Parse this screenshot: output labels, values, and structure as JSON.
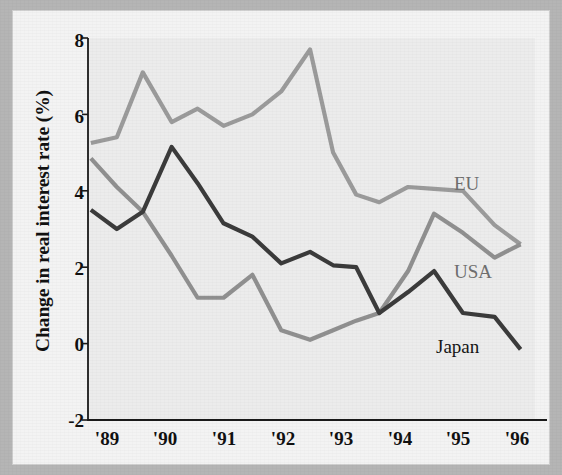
{
  "figure": {
    "ylabel": "Change in real interest rate (%)",
    "y_ticks": [
      "8",
      "6",
      "4",
      "2",
      "0",
      "-2"
    ],
    "x_ticks": [
      "'89",
      "'90",
      "'91",
      "'92",
      "'93",
      "'94",
      "'95",
      "'96"
    ],
    "labels": {
      "eu": "EU",
      "usa": "USA",
      "japan": "Japan"
    },
    "colors": {
      "eu": "#9b9b9b",
      "usa": "#909090",
      "japan": "#3b3b3b",
      "axis": "#1a1a1a",
      "plot_background": "#ececec",
      "paper": "#f3f3f3"
    }
  },
  "chart_data": {
    "type": "line",
    "title": "",
    "subtitle": "",
    "xlabel": "",
    "ylabel": "Change in real interest rate (%)",
    "xlim": [
      1988.75,
      1996.5
    ],
    "ylim": [
      -2,
      8
    ],
    "y_ticks": [
      8,
      6,
      4,
      2,
      0,
      -2
    ],
    "x_tick_values": [
      1989,
      1990,
      1991,
      1992,
      1993,
      1994,
      1995,
      1996
    ],
    "x_tick_labels": [
      "'89",
      "'90",
      "'91",
      "'92",
      "'93",
      "'94",
      "'95",
      "'96"
    ],
    "grid": false,
    "legend": "inline-labels-right",
    "annotations": [
      {
        "text": "EU",
        "x": 1995.1,
        "y": 4.6
      },
      {
        "text": "USA",
        "x": 1995.1,
        "y": 2.3
      },
      {
        "text": "Japan",
        "x": 1994.8,
        "y": 0.35
      }
    ],
    "x": [
      1988.8,
      1989.25,
      1989.7,
      1990.2,
      1990.65,
      1991.1,
      1991.6,
      1992.1,
      1992.6,
      1993.0,
      1993.4,
      1993.8,
      1994.3,
      1994.75,
      1995.25,
      1995.8,
      1996.25
    ],
    "series": [
      {
        "name": "EU",
        "color": "#9b9b9b",
        "values": [
          5.25,
          5.4,
          7.1,
          5.8,
          6.15,
          5.7,
          6.0,
          6.6,
          7.7,
          5.0,
          3.9,
          3.7,
          4.1,
          4.05,
          4.0,
          3.1,
          2.6
        ]
      },
      {
        "name": "USA",
        "color": "#909090",
        "values": [
          4.85,
          4.1,
          3.45,
          2.3,
          1.2,
          1.2,
          1.8,
          0.35,
          0.1,
          0.35,
          0.6,
          0.8,
          1.9,
          3.4,
          2.9,
          2.25,
          2.6
        ]
      },
      {
        "name": "Japan",
        "color": "#3b3b3b",
        "values": [
          3.5,
          3.0,
          3.45,
          5.15,
          4.2,
          3.15,
          2.8,
          2.1,
          2.4,
          2.05,
          2.0,
          0.8,
          1.35,
          1.9,
          0.8,
          0.7,
          -0.15
        ]
      }
    ]
  }
}
